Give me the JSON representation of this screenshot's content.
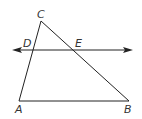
{
  "diagram": {
    "type": "geometry-triangle",
    "points": {
      "A": {
        "label": "A",
        "x": 19,
        "y": 101
      },
      "B": {
        "label": "B",
        "x": 129,
        "y": 101
      },
      "C": {
        "label": "C",
        "x": 41,
        "y": 21
      },
      "D": {
        "label": "D",
        "x": 33,
        "y": 50
      },
      "E": {
        "label": "E",
        "x": 73,
        "y": 50
      }
    },
    "segments": [
      "AB",
      "AC",
      "BC"
    ],
    "lines": [
      {
        "name": "DE",
        "type": "line-with-arrows",
        "from_x": 12,
        "to_x": 133,
        "y": 50
      }
    ],
    "colors": {
      "stroke": "#222222",
      "label": "#333333"
    }
  }
}
